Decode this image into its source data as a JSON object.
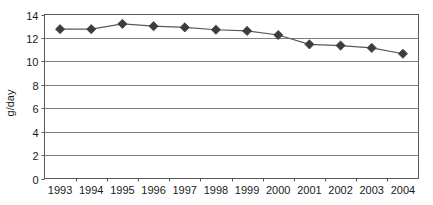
{
  "chart_data": {
    "type": "line",
    "title": "",
    "xlabel": "",
    "ylabel": "g/day",
    "categories": [
      "1993",
      "1994",
      "1995",
      "1996",
      "1997",
      "1998",
      "1999",
      "2000",
      "2001",
      "2002",
      "2003",
      "2004"
    ],
    "values": [
      12.75,
      12.75,
      13.2,
      13.0,
      12.9,
      12.7,
      12.6,
      12.25,
      11.45,
      11.35,
      11.15,
      10.65
    ],
    "series": [
      {
        "name": "g/day",
        "values": [
          12.75,
          12.75,
          13.2,
          13.0,
          12.9,
          12.7,
          12.6,
          12.25,
          11.45,
          11.35,
          11.15,
          10.65
        ]
      }
    ],
    "ylim": [
      0,
      14
    ],
    "yticks": [
      "0",
      "2",
      "4",
      "6",
      "8",
      "10",
      "12",
      "14"
    ],
    "ytick_values": [
      0,
      2,
      4,
      6,
      8,
      10,
      12,
      14
    ],
    "xticks": [
      "1993",
      "1994",
      "1995",
      "1996",
      "1997",
      "1998",
      "1999",
      "2000",
      "2001",
      "2002",
      "2003",
      "2004"
    ],
    "grid": true,
    "grid_axis": "y",
    "legend": false,
    "legend_position": "none",
    "marker": "diamond",
    "colors": {
      "line": "#595959",
      "marker": "#3d3d3d",
      "grid": "#808080",
      "frame": "#595959",
      "text": "#1a1a1a",
      "background": "#ffffff"
    }
  },
  "axis_titles": {
    "y": "g/day"
  }
}
